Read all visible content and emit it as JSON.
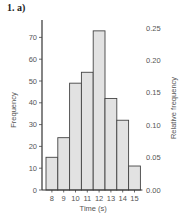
{
  "figure": {
    "label": "1. a)"
  },
  "chart_data": {
    "type": "bar",
    "title": "",
    "xlabel": "Time (s)",
    "ylabel": "Frequency",
    "y2label": "Relative frequency",
    "categories": [
      "8",
      "9",
      "10",
      "11",
      "12",
      "13",
      "14",
      "15"
    ],
    "values": [
      15,
      24,
      49,
      54,
      73,
      42,
      32,
      11
    ],
    "ylim": [
      0,
      75
    ],
    "yticks": [
      0,
      10,
      20,
      30,
      40,
      50,
      60,
      70
    ],
    "y2ticks": [
      "0.00",
      "0.05",
      "0.10",
      "0.15",
      "0.20",
      "0.25"
    ],
    "y2lim": [
      0,
      0.26
    ],
    "grid": false,
    "bar_color": "#e2e2e2",
    "edge_color": "#444444"
  }
}
